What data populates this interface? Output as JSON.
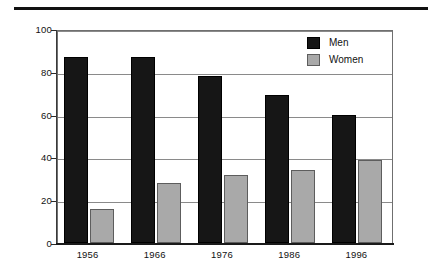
{
  "figure": {
    "top_rule": "horizontal-rule"
  },
  "chart_data": {
    "type": "bar",
    "title": "",
    "subtitle": "",
    "xlabel": "",
    "ylabel": "",
    "categories": [
      "1956",
      "1966",
      "1976",
      "1986",
      "1996"
    ],
    "series": [
      {
        "name": "Men",
        "color": "#161616",
        "values": [
          87,
          87,
          78,
          69,
          60
        ]
      },
      {
        "name": "Women",
        "color": "#a9a9a9",
        "values": [
          16,
          28,
          32,
          34,
          39
        ]
      }
    ],
    "ylim": [
      0,
      100
    ],
    "yticks": [
      0,
      20,
      40,
      60,
      80,
      100
    ],
    "ytick_labels": [
      "0",
      "20",
      "40",
      "60",
      "80",
      "100"
    ],
    "grid": true,
    "grid_axis": "y",
    "legend_position": "top-right",
    "legend": [
      {
        "label": "Men",
        "swatch": "black-square"
      },
      {
        "label": "Women",
        "swatch": "gray-square"
      }
    ]
  },
  "colors": {
    "men": "#161616",
    "women": "#a9a9a9",
    "gridline": "#8a8a8a",
    "axis": "#1a1a1a",
    "rule": "#111111",
    "background": "#ffffff"
  }
}
